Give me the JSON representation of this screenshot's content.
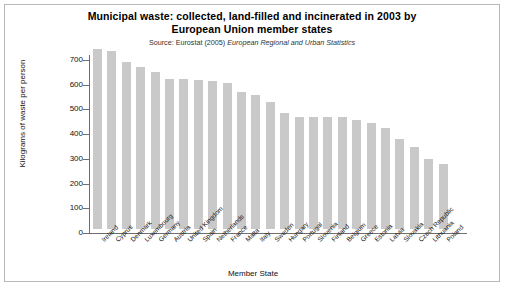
{
  "figure": {
    "title_line1": "Municipal waste: collected, land-filled and incinerated in 2003 by",
    "title_line2": "European Union member states",
    "source_prefix": "Source: Eurostat (2005) ",
    "source_italic": "European Regional and Urban Statistics"
  },
  "chart_data": {
    "type": "bar",
    "title": "Municipal waste: collected, land-filled and incinerated in 2003 by European Union member states",
    "subtitle": "Source: Eurostat (2005) European Regional and Urban Statistics",
    "xlabel": "Member State",
    "ylabel": "Kilograms of waste per person",
    "ylim": [
      0,
      700
    ],
    "yticks": [
      0,
      100,
      200,
      300,
      400,
      500,
      600,
      700
    ],
    "ytick_labels": [
      "0",
      "100",
      "200",
      "300",
      "400",
      "500",
      "600",
      "700"
    ],
    "grid": false,
    "legend": null,
    "bar_color": "#c9c9c9",
    "categories": [
      "Ireland",
      "Cyprus",
      "Denmark",
      "Luxembourg",
      "Germany",
      "Austria",
      "United Kingdom",
      "Spain",
      "Netherlands",
      "France",
      "Malta",
      "Italy",
      "Sweden",
      "Hungary",
      "Portugal",
      "Slovenia",
      "Finland",
      "Belgium",
      "Greece",
      "Estonia",
      "Latvia",
      "Slovakia",
      "Czech Republic",
      "Lithuania",
      "Poland"
    ],
    "values": [
      730,
      720,
      675,
      657,
      637,
      605,
      607,
      604,
      598,
      592,
      556,
      543,
      515,
      470,
      455,
      455,
      455,
      455,
      440,
      428,
      410,
      365,
      330,
      285,
      265
    ]
  }
}
